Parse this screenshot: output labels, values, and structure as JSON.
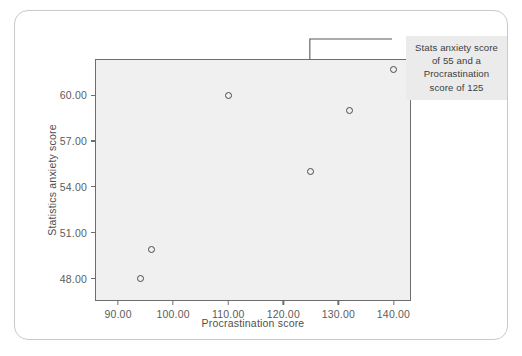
{
  "chart_data": {
    "type": "scatter",
    "title": "",
    "xlabel": "Procrastination score",
    "ylabel": "Statistics anxiety score",
    "xlim": [
      86,
      143
    ],
    "ylim": [
      46.6,
      62.3
    ],
    "xticks": [
      "90.00",
      "100.00",
      "110.00",
      "120.00",
      "130.00",
      "140.00"
    ],
    "xtick_values": [
      90,
      100,
      110,
      120,
      130,
      140
    ],
    "yticks": [
      "48.00",
      "51.00",
      "54.00",
      "57.00",
      "60.00"
    ],
    "ytick_values": [
      48,
      51,
      54,
      57,
      60
    ],
    "grid": false,
    "legend": null,
    "points": [
      {
        "x": 94,
        "y": 48.0
      },
      {
        "x": 96,
        "y": 49.9
      },
      {
        "x": 110,
        "y": 60.0
      },
      {
        "x": 125,
        "y": 55.0
      },
      {
        "x": 132,
        "y": 59.0
      },
      {
        "x": 140,
        "y": 61.7
      }
    ],
    "annotations": [
      {
        "target_x": 125,
        "target_y": 55,
        "lines": [
          "Stats anxiety score",
          "of 55 and a",
          "Procrastination",
          "score of 125"
        ]
      }
    ]
  },
  "colors": {
    "card_border": "#c9c9c9",
    "plot_background": "#f0f0f0",
    "plot_border": "#6e6e6e",
    "point_stroke": "#4a4a4a",
    "annotation_background": "#ebebeb",
    "annotation_text": "#3d3d3d",
    "tick_text": "#5c5c5c",
    "axis_title": "#4f4f4f",
    "leader_line": "#5a5a5a"
  }
}
